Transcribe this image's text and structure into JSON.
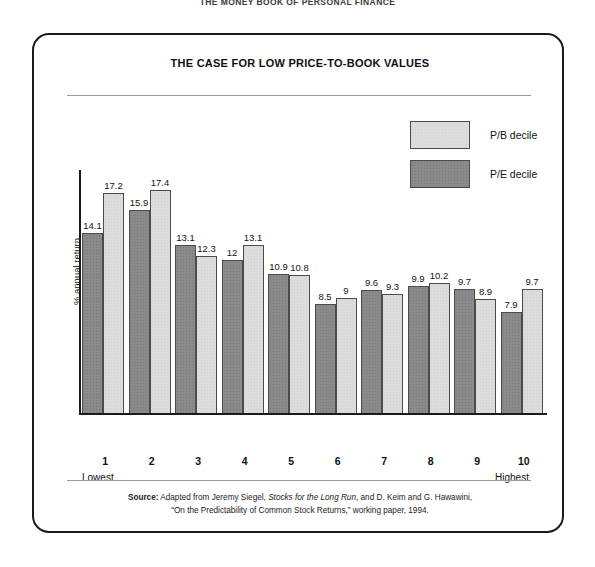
{
  "page_header": "THE MONEY BOOK OF PERSONAL FINANCE",
  "figure": {
    "title": "THE CASE FOR LOW PRICE-TO-BOOK VALUES",
    "legend": [
      {
        "key": "pb",
        "label": "P/B decile",
        "color": "#dcdcdc"
      },
      {
        "key": "pe",
        "label": "P/E decile",
        "color": "#8a8a8a"
      }
    ],
    "source": {
      "label": "Source:",
      "line1_part1": " Adapted from Jeremy Siegel, ",
      "line1_italic": "Stocks for the Long Run",
      "line1_part2": ", and D. Keim and G. Hawawini,",
      "line2": "“On the Predictability of Common Stock Returns,” working paper, 1994."
    }
  },
  "chart_data": {
    "type": "bar",
    "title": "THE CASE FOR LOW PRICE-TO-BOOK VALUES",
    "xlabel": "",
    "ylabel": "% annual return",
    "categories": [
      "1",
      "2",
      "3",
      "4",
      "5",
      "6",
      "7",
      "8",
      "9",
      "10"
    ],
    "category_low_label": "Lowest",
    "category_high_label": "Highest",
    "ylim": [
      0,
      19
    ],
    "grid": false,
    "legend_position": "top-right",
    "series": [
      {
        "name": "P/E decile",
        "color": "#8a8a8a",
        "values": [
          14.1,
          15.9,
          13.1,
          12,
          10.9,
          8.5,
          9.6,
          9.9,
          9.7,
          7.9
        ],
        "labels": [
          "14.1",
          "15.9",
          "13.1",
          "12",
          "10.9",
          "8.5",
          "9.6",
          "9.9",
          "9.7",
          "7.9"
        ]
      },
      {
        "name": "P/B decile",
        "color": "#dcdcdc",
        "values": [
          17.2,
          17.4,
          12.3,
          13.1,
          10.8,
          9,
          9.3,
          10.2,
          8.9,
          9.7
        ],
        "labels": [
          "17.2",
          "17.4",
          "12.3",
          "13.1",
          "10.8",
          "9",
          "9.3",
          "10.2",
          "8.9",
          "9.7"
        ]
      }
    ]
  }
}
